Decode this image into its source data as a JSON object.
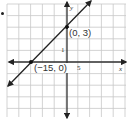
{
  "chart_data": {
    "type": "line",
    "title": "",
    "xlabel": "x",
    "ylabel": "y",
    "x_tick_label": "5",
    "y_tick_label": "1",
    "x_units_per_cell": 5,
    "y_units_per_cell": 1,
    "xlim": [
      -25,
      25
    ],
    "ylim": [
      -5,
      5
    ],
    "grid": true,
    "legend": "none",
    "series": [
      {
        "name": "line",
        "equation": "y = x/5 + 3",
        "slope": 0.2,
        "y_intercept": 3,
        "x_intercept": -15,
        "points": [
          {
            "x": -15,
            "y": 0,
            "label": "(−15, 0)"
          },
          {
            "x": 0,
            "y": 3,
            "label": "(0, 3)"
          }
        ]
      }
    ]
  },
  "labels": {
    "x_axis": "x",
    "y_axis": "y",
    "x_tick": "5",
    "y_tick": "1",
    "point_a": "(−15, 0)",
    "point_b": "(0, 3)"
  },
  "colors": {
    "grid": "#c8c8c8",
    "axis": "#333333",
    "line": "#222222",
    "point": "#111111"
  }
}
